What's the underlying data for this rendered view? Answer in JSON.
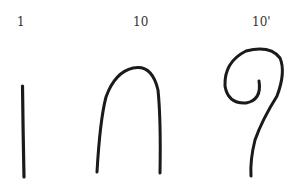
{
  "labels": [
    {
      "id": "stroke-1",
      "text": "1"
    },
    {
      "id": "stroke-10",
      "text": "10"
    },
    {
      "id": "stroke-10-prime",
      "text": "10'"
    }
  ],
  "stroke_color": "#1a1a1a"
}
